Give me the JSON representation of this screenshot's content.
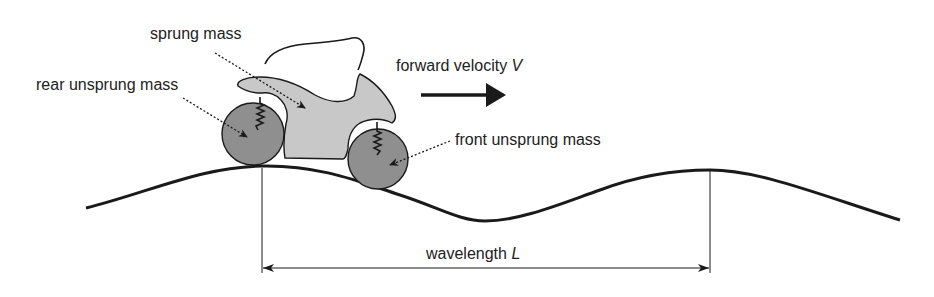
{
  "diagram": {
    "labels": {
      "sprung_mass": "sprung mass",
      "rear_unsprung_mass": "rear unsprung mass",
      "front_unsprung_mass": "front unsprung mass",
      "forward_velocity": "forward velocity",
      "forward_velocity_symbol": "V",
      "wavelength": "wavelength",
      "wavelength_symbol": "L"
    },
    "colors": {
      "outline": "#1a1a1a",
      "body_fill": "#c8c8c8",
      "wheel_fill": "#8f8f8f",
      "text": "#222222",
      "background": "#ffffff"
    },
    "components": [
      {
        "name": "sprung-mass",
        "description": "motorcycle body/frame (light grey)"
      },
      {
        "name": "rider",
        "description": "rider outline above body"
      },
      {
        "name": "rear-wheel",
        "description": "rear unsprung mass (dark grey circle)"
      },
      {
        "name": "front-wheel",
        "description": "front unsprung mass (dark grey circle)"
      },
      {
        "name": "rear-spring",
        "description": "rear suspension spring"
      },
      {
        "name": "front-spring",
        "description": "front suspension spring"
      },
      {
        "name": "road-profile",
        "description": "sinusoidal road surface"
      },
      {
        "name": "velocity-arrow",
        "description": "bold arrow pointing right"
      },
      {
        "name": "wavelength-dimension",
        "description": "double-headed arrow between two road peaks"
      }
    ]
  }
}
